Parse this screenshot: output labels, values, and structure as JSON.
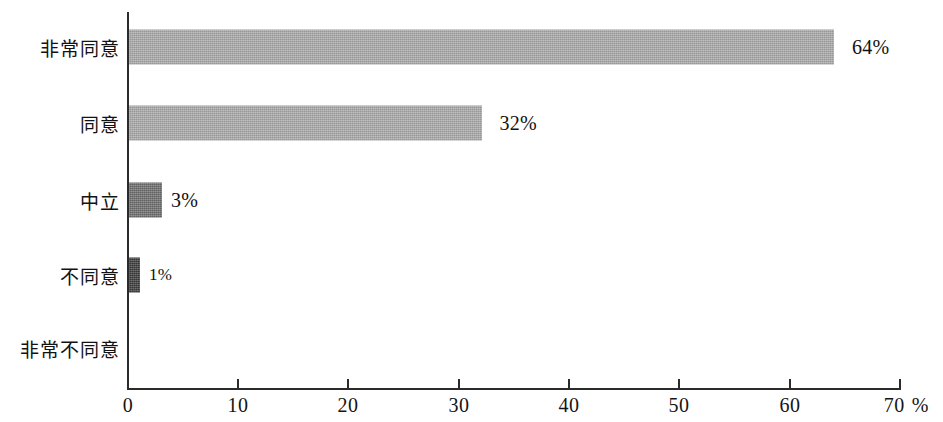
{
  "chart_data": {
    "type": "bar",
    "orientation": "horizontal",
    "title": "",
    "subtitle": "",
    "xlabel": "",
    "ylabel": "",
    "x_unit": "%",
    "xlim": [
      0,
      70
    ],
    "x_ticks": [
      0,
      10,
      20,
      30,
      40,
      50,
      60,
      70
    ],
    "x_tick_labels": [
      "0",
      "10",
      "20",
      "30",
      "40",
      "50",
      "60",
      "70"
    ],
    "grid": false,
    "legend": false,
    "legend_position": "none",
    "categories": [
      "非常同意",
      "同意",
      "中立",
      "不同意",
      "非常不同意"
    ],
    "values": [
      64,
      32,
      3,
      1,
      0
    ],
    "value_labels": [
      "64%",
      "32%",
      "3%",
      "1%",
      ""
    ],
    "bar_colors": [
      "#a9a9a9",
      "#a9a9a9",
      "#6e6e6e",
      "#3d3d3d",
      "#3d3d3d"
    ],
    "series": [
      {
        "name": "",
        "values": [
          64,
          32,
          3,
          1,
          0
        ]
      }
    ],
    "bars": [
      {
        "category": "非常同意",
        "value": 64,
        "label": "64%",
        "tone": "light"
      },
      {
        "category": "同意",
        "value": 32,
        "label": "32%",
        "tone": "light"
      },
      {
        "category": "中立",
        "value": 3,
        "label": "3%",
        "tone": "dark"
      },
      {
        "category": "不同意",
        "value": 1,
        "label": "1%",
        "tone": "darkest"
      },
      {
        "category": "非常不同意",
        "value": 0,
        "label": "",
        "tone": "none"
      }
    ]
  },
  "axis": {
    "unit_suffix": "%",
    "tick_0": "0",
    "tick_10": "10",
    "tick_20": "20",
    "tick_30": "30",
    "tick_40": "40",
    "tick_50": "50",
    "tick_60": "60",
    "tick_70": "70"
  },
  "rows": {
    "r0": {
      "label": "非常同意",
      "value_label": "64%"
    },
    "r1": {
      "label": "同意",
      "value_label": "32%"
    },
    "r2": {
      "label": "中立",
      "value_label": "3%"
    },
    "r3": {
      "label": "不同意",
      "value_label": "1%"
    },
    "r4": {
      "label": "非常不同意",
      "value_label": ""
    }
  }
}
